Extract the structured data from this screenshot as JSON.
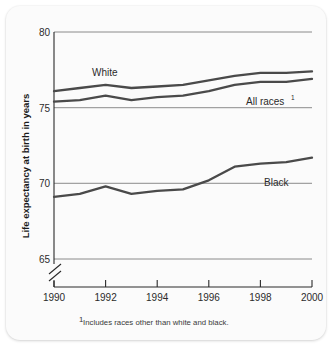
{
  "chart_data": {
    "type": "line",
    "title": "",
    "xlabel": "",
    "ylabel": "Life expectancy at birth in years",
    "xlim": [
      1990,
      2000
    ],
    "ylim": [
      65,
      80
    ],
    "grid": true,
    "legend_position": "inline-labels",
    "axis_break": true,
    "x": [
      1990,
      1991,
      1992,
      1993,
      1994,
      1995,
      1996,
      1997,
      1998,
      1999,
      2000
    ],
    "xticks": [
      "1990",
      "1992",
      "1994",
      "1996",
      "1998",
      "2000"
    ],
    "yticks": [
      "65",
      "70",
      "75",
      "80"
    ],
    "series": [
      {
        "name": "White",
        "label": "White",
        "values": [
          76.1,
          76.3,
          76.5,
          76.3,
          76.4,
          76.5,
          76.8,
          77.1,
          77.3,
          77.3,
          77.4
        ]
      },
      {
        "name": "All races",
        "label": "All races",
        "label_superscript": "1",
        "values": [
          75.4,
          75.5,
          75.8,
          75.5,
          75.7,
          75.8,
          76.1,
          76.5,
          76.7,
          76.7,
          76.9
        ]
      },
      {
        "name": "Black",
        "label": "Black",
        "values": [
          69.1,
          69.3,
          69.8,
          69.3,
          69.5,
          69.6,
          70.2,
          71.1,
          71.3,
          71.4,
          71.7
        ]
      }
    ],
    "footnote": "Includes races other than white and black.",
    "footnote_marker": "1",
    "colors": {
      "line": "#4a4a4a",
      "grid": "#6e6e6e",
      "axis": "#2a2a2a",
      "text": "#2b2b2b",
      "background": "#fbfbfb"
    }
  }
}
